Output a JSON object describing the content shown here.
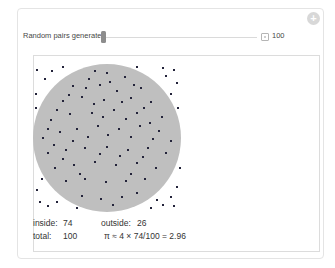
{
  "widget": {
    "control": {
      "label": "Random pairs generated",
      "value": "100"
    },
    "plus_button_glyph": "+",
    "icons": {
      "field_toggle": "input-field-toggle",
      "plus_button": "show-additional-controls"
    },
    "stats": {
      "inside_label": "inside:",
      "inside_value": "74",
      "outside_label": "outside:",
      "outside_value": "26",
      "total_label": "total:",
      "total_value": "100",
      "formula": "π ≈ 4 × 74/100 = 2.96"
    },
    "colors": {
      "circle_fill": "#bfbfbf",
      "point": "#23233a",
      "plot_border": "#dcdcdc",
      "outer_border": "#e4e4e4",
      "slider_thumb": "#8d8d8d",
      "slider_track": "#dadada",
      "text": "#333333"
    }
  },
  "chart_data": {
    "type": "scatter",
    "inside_count": 74,
    "outside_count": 26,
    "total": 100,
    "pi_estimate": 2.96,
    "x_range": [
      0,
      1
    ],
    "y_range": [
      0,
      1
    ],
    "points": [
      [
        0.5,
        0.06
      ],
      [
        0.38,
        0.1
      ],
      [
        0.62,
        0.09
      ],
      [
        0.27,
        0.15
      ],
      [
        0.73,
        0.16
      ],
      [
        0.45,
        0.14
      ],
      [
        0.57,
        0.18
      ],
      [
        0.2,
        0.25
      ],
      [
        0.33,
        0.22
      ],
      [
        0.48,
        0.24
      ],
      [
        0.66,
        0.23
      ],
      [
        0.8,
        0.26
      ],
      [
        0.12,
        0.38
      ],
      [
        0.25,
        0.34
      ],
      [
        0.4,
        0.33
      ],
      [
        0.55,
        0.31
      ],
      [
        0.7,
        0.33
      ],
      [
        0.87,
        0.36
      ],
      [
        0.07,
        0.5
      ],
      [
        0.18,
        0.46
      ],
      [
        0.3,
        0.44
      ],
      [
        0.44,
        0.42
      ],
      [
        0.58,
        0.44
      ],
      [
        0.72,
        0.42
      ],
      [
        0.85,
        0.45
      ],
      [
        0.93,
        0.52
      ],
      [
        0.1,
        0.6
      ],
      [
        0.22,
        0.58
      ],
      [
        0.35,
        0.57
      ],
      [
        0.5,
        0.56
      ],
      [
        0.64,
        0.58
      ],
      [
        0.78,
        0.57
      ],
      [
        0.9,
        0.6
      ],
      [
        0.15,
        0.7
      ],
      [
        0.28,
        0.68
      ],
      [
        0.42,
        0.66
      ],
      [
        0.56,
        0.68
      ],
      [
        0.7,
        0.67
      ],
      [
        0.83,
        0.7
      ],
      [
        0.22,
        0.79
      ],
      [
        0.35,
        0.78
      ],
      [
        0.49,
        0.8
      ],
      [
        0.63,
        0.79
      ],
      [
        0.76,
        0.78
      ],
      [
        0.33,
        0.89
      ],
      [
        0.46,
        0.91
      ],
      [
        0.6,
        0.9
      ],
      [
        0.7,
        0.87
      ],
      [
        0.54,
        0.95
      ],
      [
        0.42,
        0.05
      ],
      [
        0.36,
        0.16
      ],
      [
        0.52,
        0.12
      ],
      [
        0.68,
        0.14
      ],
      [
        0.24,
        0.21
      ],
      [
        0.41,
        0.27
      ],
      [
        0.6,
        0.26
      ],
      [
        0.75,
        0.3
      ],
      [
        0.16,
        0.31
      ],
      [
        0.47,
        0.36
      ],
      [
        0.63,
        0.37
      ],
      [
        0.79,
        0.4
      ],
      [
        0.1,
        0.44
      ],
      [
        0.37,
        0.49
      ],
      [
        0.51,
        0.48
      ],
      [
        0.66,
        0.49
      ],
      [
        0.81,
        0.51
      ],
      [
        0.14,
        0.55
      ],
      [
        0.27,
        0.52
      ],
      [
        0.45,
        0.61
      ],
      [
        0.59,
        0.62
      ],
      [
        0.74,
        0.63
      ],
      [
        0.2,
        0.64
      ],
      [
        0.32,
        0.74
      ],
      [
        0.66,
        0.74
      ],
      [
        0.03,
        0.04
      ],
      [
        0.08,
        0.1
      ],
      [
        0.02,
        0.2
      ],
      [
        0.13,
        0.05
      ],
      [
        0.05,
        0.93
      ],
      [
        0.1,
        0.96
      ],
      [
        0.03,
        0.85
      ],
      [
        0.16,
        0.93
      ],
      [
        0.06,
        0.78
      ],
      [
        0.95,
        0.04
      ],
      [
        0.9,
        0.08
      ],
      [
        0.97,
        0.13
      ],
      [
        0.88,
        0.03
      ],
      [
        0.93,
        0.2
      ],
      [
        0.98,
        0.3
      ],
      [
        0.93,
        0.9
      ],
      [
        0.97,
        0.83
      ],
      [
        0.88,
        0.95
      ],
      [
        0.95,
        0.96
      ],
      [
        0.84,
        0.92
      ],
      [
        0.99,
        0.7
      ],
      [
        0.02,
        0.3
      ],
      [
        0.2,
        0.02
      ],
      [
        0.8,
        0.97
      ],
      [
        0.3,
        0.97
      ],
      [
        0.7,
        0.02
      ]
    ]
  }
}
